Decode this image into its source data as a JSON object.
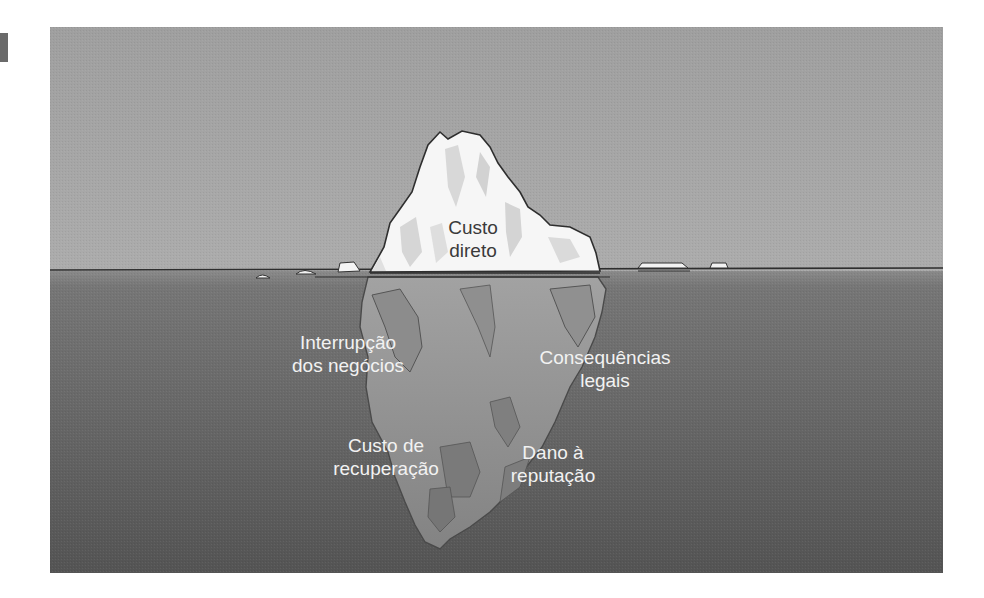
{
  "figure": {
    "colors": {
      "sky": "#a6a6a6",
      "water_top": "#7e7e7e",
      "water_bottom": "#555555",
      "ice_above": "#f4f4f4",
      "ice_below": "#9a9a9a",
      "waterline": "#2e2e2e",
      "label_light": "#f2f2f2",
      "label_dark": "#3a3a3a"
    },
    "labels": {
      "above_water": {
        "line1": "Custo",
        "line2": "direto"
      },
      "business_interruption": {
        "line1": "Interrupção",
        "line2": "dos negócios"
      },
      "legal_consequences": {
        "line1": "Consequências",
        "line2": "legais"
      },
      "recovery_cost": {
        "line1": "Custo de",
        "line2": "recuperação"
      },
      "reputation_damage": {
        "line1": "Dano à",
        "line2": "reputação"
      }
    }
  }
}
